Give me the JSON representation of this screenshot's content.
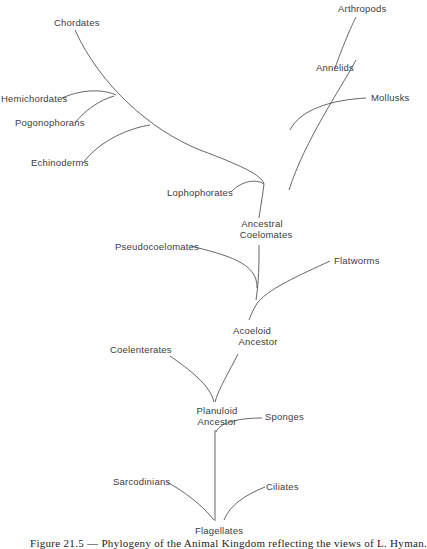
{
  "diagram": {
    "type": "phylogenetic-tree",
    "nodes": {
      "arthropods": "Arthropods",
      "annelids": "Annelids",
      "mollusks": "Mollusks",
      "chordates": "Chordates",
      "hemichordates": "Hemichordates",
      "pogonophorans": "Pogonophorans",
      "echinoderms": "Echinoderms",
      "lophophorates": "Lophophorates",
      "ancestral_coelomates": [
        "Ancestral",
        "Coelomates"
      ],
      "pseudocoelomates": "Pseudocoelomates",
      "flatworms": "Flatworms",
      "acoeloid_ancestor": [
        "Acoeloid",
        "Ancestor"
      ],
      "coelenterates": "Coelenterates",
      "planuloid_ancestor": [
        "Planuloid",
        "Ancestor"
      ],
      "sponges": "Sponges",
      "sarcodinians": "Sarcodinians",
      "ciliates": "Ciliates",
      "flagellates": "Flagellates"
    },
    "edges": [
      [
        "flagellates",
        "planuloid_ancestor"
      ],
      [
        "flagellates",
        "sarcodinians"
      ],
      [
        "flagellates",
        "ciliates"
      ],
      [
        "planuloid_ancestor",
        "sponges"
      ],
      [
        "planuloid_ancestor",
        "coelenterates"
      ],
      [
        "planuloid_ancestor",
        "acoeloid_ancestor"
      ],
      [
        "acoeloid_ancestor",
        "flatworms"
      ],
      [
        "acoeloid_ancestor",
        "pseudocoelomates"
      ],
      [
        "acoeloid_ancestor",
        "ancestral_coelomates"
      ],
      [
        "ancestral_coelomates",
        "lophophorates"
      ],
      [
        "ancestral_coelomates",
        "echinoderms"
      ],
      [
        "ancestral_coelomates",
        "pogonophorans"
      ],
      [
        "ancestral_coelomates",
        "hemichordates"
      ],
      [
        "ancestral_coelomates",
        "chordates"
      ],
      [
        "ancestral_coelomates",
        "mollusks"
      ],
      [
        "ancestral_coelomates",
        "annelids"
      ],
      [
        "annelids",
        "arthropods"
      ]
    ]
  },
  "caption": "Figure 21.5 — Phylogeny of the Animal Kingdom reflecting the views of L. Hyman."
}
